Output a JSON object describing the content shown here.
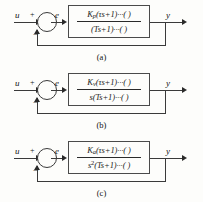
{
  "figure": {
    "type": "control-system-block-diagrams",
    "diagrams": [
      {
        "caption": "(a)",
        "input_label": "u",
        "error_label": "e",
        "output_label": "y",
        "summing_junction": {
          "reference_sign": "+",
          "feedback_sign": "−"
        },
        "transfer_function": {
          "numerator": "Kₚ(τs+1)···( )",
          "numerator_gain": "K",
          "numerator_gain_sub": "p",
          "numerator_rest": "(τs+1)···(    )",
          "denominator": "(Ts+1)···( )",
          "denominator_lead": "",
          "denominator_lead_sup": "",
          "denominator_rest": "(Ts+1)···(    )"
        }
      },
      {
        "caption": "(b)",
        "input_label": "u",
        "error_label": "e",
        "output_label": "y",
        "summing_junction": {
          "reference_sign": "+",
          "feedback_sign": "−"
        },
        "transfer_function": {
          "numerator": "Kᵥ(τs+1)···( )",
          "numerator_gain": "K",
          "numerator_gain_sub": "v",
          "numerator_rest": "(τs+1)···(    )",
          "denominator": "s(Ts+1)···( )",
          "denominator_lead": "s",
          "denominator_lead_sup": "",
          "denominator_rest": "(Ts+1)···(    )"
        }
      },
      {
        "caption": "(c)",
        "input_label": "u",
        "error_label": "e",
        "output_label": "y",
        "summing_junction": {
          "reference_sign": "+",
          "feedback_sign": "−"
        },
        "transfer_function": {
          "numerator": "Kₐ(τs+1)···( )",
          "numerator_gain": "K",
          "numerator_gain_sub": "a",
          "numerator_rest": "(τs+1)···(    )",
          "denominator": "s²(Ts+1)···( )",
          "denominator_lead": "s",
          "denominator_lead_sup": "2",
          "denominator_rest": "(Ts+1)···(    )"
        }
      }
    ]
  },
  "colors": {
    "background": "#fdfdfb",
    "line": "#3a3a3a",
    "text": "#1a1a1a"
  }
}
